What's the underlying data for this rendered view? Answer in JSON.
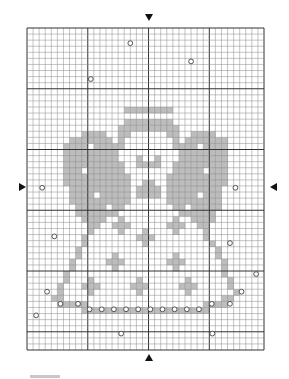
{
  "pattern": {
    "title": "Angel cross-stitch chart",
    "columns": 39,
    "rows": 53,
    "major_every": 10,
    "colors": {
      "stitch": "#bdbdbd",
      "stitch_dark": "#a9a9a9",
      "grid_minor": "#8a8a8a",
      "grid_major": "#333333",
      "bead_stroke": "#444444"
    },
    "stitches": [
      ".......................................",
      ".......................................",
      ".......................................",
      ".......................................",
      ".......................................",
      ".......................................",
      ".......................................",
      ".......................................",
      ".......................................",
      ".......................................",
      ".......................................",
      ".......................................",
      ".......................................",
      "................XXXXXXXX...............",
      ".......................................",
      "................XXXXXXXX...............",
      "...............XXXXXXXXXX..............",
      ".........XXXX..XX......XX..XXXX........",
      ".......XXXXXXX.X........X.XXXXXXX......",
      "......XXXX.XXXXX........XXXX.XXXX......",
      "......XXXXXXXXX..........XXXXXXXX......",
      "......XXXXXXXXX...X..X...XXXXXXXX......",
      "......XXXXXXXXXX..XXXX..XXXXXXXXX......",
      "......XXX.XXXXXX........XXXXX.XXX......",
      "......XXXXXXXXXXX......XXXXXXXXXX......",
      "......XXXXXXXXXXX..XX..XXXXXXXXXX......",
      ".......XXXXXXXXXX.XXXX.XXXXXXXXX.......",
      ".......XXXX.XXXXX.XXXX.XXXXX.XXX.......",
      ".......XXXXXXXXXX......XXXXXXXXX.......",
      "........XXXXX.XX........XX.XXXXX.......",
      "........XXXXXXX..........XXXXXX........",
      ".........XXXX..X........X..XXXX........",
      "..........XX..XXX......XXX..XX.........",
      "..........X....X...X....X....X.........",
      ".........X........XXX........X.........",
      ".........X.........X..........X........",
      "........X......................X.......",
      "........X.....X.........X......X.......",
      ".......X.....XXX.......XXX......X......",
      ".......X......X.........X.......X......",
      "......X.........................X......",
      "......X...X.......X.......X......X.....",
      ".....X...XXX.....XXX.....XXX.....X.....",
      ".....X....X.......X.......X.......X....",
      "....XX..........................XX.....",
      ".....XXXXX...................XXXX......",
      ".........XXXXXXXXXXXXXXXXXXXXX.........",
      ".......................................",
      ".......................................",
      ".......................................",
      ".......................................",
      ".......................................",
      "......................................."
    ],
    "beads": [
      [
        17,
        2.5
      ],
      [
        27,
        5.5
      ],
      [
        10.5,
        8.4
      ],
      [
        2.5,
        26.3
      ],
      [
        34.3,
        26.3
      ],
      [
        4.5,
        34.3
      ],
      [
        33.4,
        35.4
      ],
      [
        37.7,
        40.5
      ],
      [
        3.3,
        43.4
      ],
      [
        35.3,
        43.4
      ],
      [
        5.5,
        45.4
      ],
      [
        8.4,
        45.4
      ],
      [
        30.4,
        45.4
      ],
      [
        33.4,
        45.4
      ],
      [
        10.3,
        46.3
      ],
      [
        12.3,
        46.3
      ],
      [
        14.3,
        46.3
      ],
      [
        16.3,
        46.3
      ],
      [
        18.3,
        46.3
      ],
      [
        20.3,
        46.3
      ],
      [
        22.3,
        46.3
      ],
      [
        24.3,
        46.3
      ],
      [
        26.3,
        46.3
      ],
      [
        28.3,
        46.3
      ],
      [
        1.5,
        47.3
      ],
      [
        15.5,
        50.3
      ],
      [
        30.5,
        50.3
      ]
    ]
  },
  "markers": {
    "top": "center-arrow-down",
    "bottom": "center-arrow-up",
    "left": "center-arrow-right",
    "right": "center-arrow-left"
  }
}
